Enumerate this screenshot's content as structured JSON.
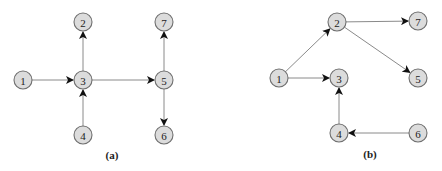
{
  "diagrams": [
    {
      "caption": "(a)",
      "caption_pos": [
        112,
        159
      ],
      "nodes": [
        {
          "id": "1",
          "label": "1",
          "x": 23,
          "y": 80
        },
        {
          "id": "2",
          "label": "2",
          "x": 83,
          "y": 22
        },
        {
          "id": "3",
          "label": "3",
          "x": 83,
          "y": 80
        },
        {
          "id": "4",
          "label": "4",
          "x": 83,
          "y": 135
        },
        {
          "id": "5",
          "label": "5",
          "x": 164,
          "y": 80
        },
        {
          "id": "6",
          "label": "6",
          "x": 164,
          "y": 135
        },
        {
          "id": "7",
          "label": "7",
          "x": 164,
          "y": 22
        }
      ],
      "edges": [
        {
          "from": "1",
          "to": "3"
        },
        {
          "from": "3",
          "to": "2"
        },
        {
          "from": "4",
          "to": "3"
        },
        {
          "from": "3",
          "to": "5"
        },
        {
          "from": "5",
          "to": "7"
        },
        {
          "from": "5",
          "to": "6"
        }
      ]
    },
    {
      "caption": "(b)",
      "caption_pos": [
        370,
        158
      ],
      "nodes": [
        {
          "id": "1",
          "label": "1",
          "x": 279,
          "y": 78
        },
        {
          "id": "2",
          "label": "2",
          "x": 337,
          "y": 22
        },
        {
          "id": "3",
          "label": "3",
          "x": 339,
          "y": 78
        },
        {
          "id": "4",
          "label": "4",
          "x": 339,
          "y": 133
        },
        {
          "id": "5",
          "label": "5",
          "x": 418,
          "y": 78
        },
        {
          "id": "6",
          "label": "6",
          "x": 418,
          "y": 133
        },
        {
          "id": "7",
          "label": "7",
          "x": 418,
          "y": 21
        }
      ],
      "edges": [
        {
          "from": "1",
          "to": "2"
        },
        {
          "from": "1",
          "to": "3"
        },
        {
          "from": "2",
          "to": "7"
        },
        {
          "from": "2",
          "to": "5"
        },
        {
          "from": "4",
          "to": "3"
        },
        {
          "from": "6",
          "to": "4"
        }
      ]
    }
  ],
  "style": {
    "node_radius": 9,
    "node_fill": "#dcdcdc",
    "node_stroke": "#6f6f6f",
    "edge_color": "#8a8a8a",
    "arrow_color": "#111111"
  }
}
